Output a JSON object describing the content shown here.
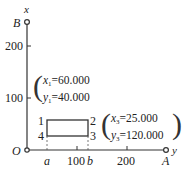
{
  "axes": {
    "vertical_axis_label": "x",
    "horizontal_axis_label": "y",
    "origin_label": "O",
    "top_point_label": "B",
    "right_point_label": "A",
    "vertical_ticks": [
      "200",
      "100"
    ],
    "horizontal_ticks": [
      "100",
      "200"
    ],
    "horizontal_markers": [
      "a",
      "b"
    ]
  },
  "rectangle": {
    "corner_labels": [
      "1",
      "2",
      "3",
      "4"
    ]
  },
  "point1": {
    "x_name": "x",
    "x_sub": "1",
    "x_value": "=60.000",
    "y_name": "y",
    "y_sub": "1",
    "y_value": "=40.000"
  },
  "point3": {
    "x_name": "x",
    "x_sub": "3",
    "x_value": "=25.000",
    "y_name": "y",
    "y_sub": "3",
    "y_value": "=120.000"
  },
  "colors": {
    "line": "#333333",
    "background": "#ffffff"
  }
}
